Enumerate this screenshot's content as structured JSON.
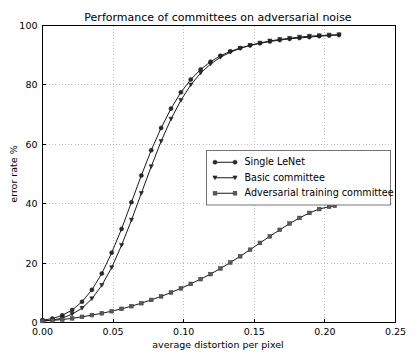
{
  "chart_data": {
    "type": "line",
    "title": "Performance of committees on adversarial noise",
    "xlabel": "average distortion per pixel",
    "ylabel": "error rate %",
    "xlim": [
      0.0,
      0.25
    ],
    "ylim": [
      0,
      100
    ],
    "xticks": [
      "0.00",
      "0.05",
      "0.10",
      "0.15",
      "0.20",
      "0.25"
    ],
    "xtick_values": [
      0.0,
      0.05,
      0.1,
      0.15,
      0.2,
      0.25
    ],
    "yticks": [
      "0",
      "20",
      "40",
      "60",
      "80",
      "100"
    ],
    "ytick_values": [
      0,
      20,
      40,
      60,
      80,
      100
    ],
    "grid": true,
    "legend_position": "center-right",
    "series": [
      {
        "name": "Single LeNet",
        "marker": "circle",
        "x": [
          0.0,
          0.007,
          0.014,
          0.021,
          0.028,
          0.035,
          0.042,
          0.049,
          0.056,
          0.063,
          0.07,
          0.077,
          0.084,
          0.091,
          0.098,
          0.105,
          0.112,
          0.119,
          0.126,
          0.133,
          0.14,
          0.147,
          0.154,
          0.161,
          0.168,
          0.175,
          0.182,
          0.189,
          0.196,
          0.203,
          0.21
        ],
        "y": [
          0.8,
          1.3,
          2.4,
          4.2,
          7.0,
          11.0,
          16.5,
          23.5,
          31.5,
          40.5,
          49.5,
          58.0,
          65.5,
          72.0,
          77.5,
          81.8,
          85.2,
          87.8,
          89.8,
          91.3,
          92.4,
          93.3,
          94.0,
          94.6,
          95.1,
          95.5,
          95.8,
          96.1,
          96.4,
          96.6,
          96.8
        ]
      },
      {
        "name": "Basic committee",
        "marker": "triangle-down",
        "x": [
          0.0,
          0.007,
          0.014,
          0.021,
          0.028,
          0.035,
          0.042,
          0.049,
          0.056,
          0.063,
          0.07,
          0.077,
          0.084,
          0.091,
          0.098,
          0.105,
          0.112,
          0.119,
          0.126,
          0.133,
          0.14,
          0.147,
          0.154,
          0.161,
          0.168,
          0.175,
          0.182,
          0.189,
          0.196,
          0.203,
          0.21
        ],
        "y": [
          0.5,
          0.8,
          1.5,
          2.8,
          4.8,
          8.0,
          12.5,
          18.5,
          26.0,
          34.5,
          43.5,
          52.5,
          61.0,
          68.5,
          74.8,
          80.0,
          84.0,
          87.0,
          89.3,
          91.0,
          92.3,
          93.3,
          94.1,
          94.8,
          95.3,
          95.7,
          96.1,
          96.4,
          96.6,
          96.8,
          96.9
        ]
      },
      {
        "name": "Adversarial training committee",
        "marker": "square",
        "x": [
          0.0,
          0.007,
          0.014,
          0.021,
          0.028,
          0.035,
          0.042,
          0.049,
          0.056,
          0.063,
          0.07,
          0.077,
          0.084,
          0.091,
          0.098,
          0.105,
          0.112,
          0.119,
          0.126,
          0.133,
          0.14,
          0.147,
          0.154,
          0.161,
          0.168,
          0.175,
          0.182,
          0.189,
          0.196,
          0.203,
          0.207
        ],
        "y": [
          0.5,
          0.7,
          1.0,
          1.4,
          1.9,
          2.5,
          3.1,
          3.8,
          4.6,
          5.5,
          6.5,
          7.6,
          8.8,
          10.1,
          11.5,
          13.0,
          14.6,
          16.3,
          18.2,
          20.2,
          22.3,
          24.5,
          26.8,
          29.0,
          31.2,
          33.3,
          35.2,
          36.9,
          38.2,
          39.0,
          39.3
        ]
      }
    ]
  }
}
